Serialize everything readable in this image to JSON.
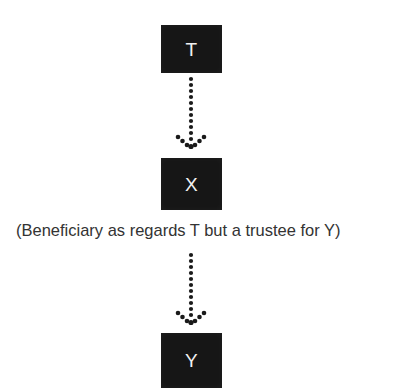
{
  "diagram": {
    "background_color": "#ffffff",
    "node_fill_color": "#161616",
    "node_text_color": "#f2f2f2",
    "connector_color": "#1a1a1a",
    "caption_color": "#333333",
    "nodes": [
      {
        "id": "t",
        "label": "T",
        "name": "node-t"
      },
      {
        "id": "x",
        "label": "X",
        "name": "node-x"
      },
      {
        "id": "y",
        "label": "Y",
        "name": "node-y"
      }
    ],
    "connectors": [
      {
        "id": "t-x",
        "from": "T",
        "to": "X",
        "style": "dotted",
        "arrowhead": "dotted-v",
        "direction": "down"
      },
      {
        "id": "x-y",
        "from": "X",
        "to": "Y",
        "style": "dotted",
        "arrowhead": "dotted-v",
        "direction": "down"
      }
    ],
    "caption": "(Beneficiary as regards T but a trustee for Y)"
  }
}
